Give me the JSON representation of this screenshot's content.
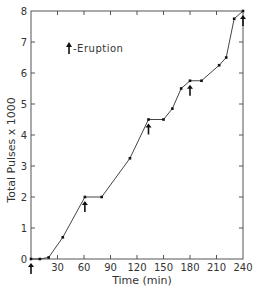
{
  "chart_data": {
    "type": "line",
    "title": "",
    "xlabel": "Time (min)",
    "ylabel": "Total Pulses x 1000",
    "xlim": [
      0,
      240
    ],
    "ylim": [
      0,
      8
    ],
    "grid": false,
    "x_ticks": [
      0,
      30,
      60,
      90,
      120,
      150,
      180,
      210,
      240
    ],
    "x_tick_labels": [
      "0",
      "30",
      "60",
      "90",
      "120",
      "150",
      "180",
      "210",
      "240"
    ],
    "y_ticks": [
      0,
      1,
      2,
      3,
      4,
      5,
      6,
      7,
      8
    ],
    "y_tick_labels": [
      "0",
      "1",
      "2",
      "3",
      "4",
      "5",
      "6",
      "7",
      "8"
    ],
    "legend": {
      "position": "upper-left",
      "entries": [
        {
          "symbol": "arrow-up",
          "label": "-Eruption"
        }
      ]
    },
    "series": [
      {
        "name": "Total Pulses",
        "x": [
          0,
          10,
          20,
          36,
          61,
          80,
          112,
          133,
          150,
          160,
          170,
          180,
          193,
          213,
          221,
          230,
          240
        ],
        "y": [
          0,
          0,
          0.05,
          0.7,
          2.0,
          2.0,
          3.25,
          4.5,
          4.5,
          4.85,
          5.5,
          5.75,
          5.75,
          6.25,
          6.5,
          7.75,
          8.0
        ]
      }
    ],
    "annotations": [
      {
        "type": "eruption-arrow",
        "x": 0,
        "y": 0
      },
      {
        "type": "eruption-arrow",
        "x": 61,
        "y": 2.0
      },
      {
        "type": "eruption-arrow",
        "x": 133,
        "y": 4.5
      },
      {
        "type": "eruption-arrow",
        "x": 180,
        "y": 5.75
      },
      {
        "type": "eruption-arrow",
        "x": 240,
        "y": 8.0
      }
    ]
  },
  "labels": {
    "xlabel": "Time (min)",
    "ylabel": "Total Pulses x 1000",
    "legend": "-Eruption"
  }
}
